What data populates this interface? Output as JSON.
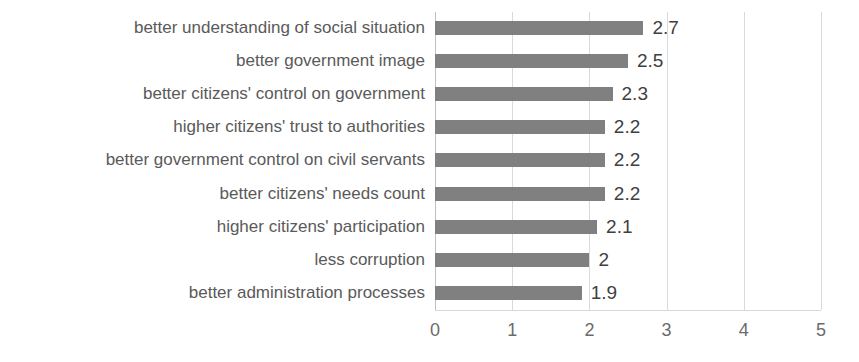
{
  "chart_data": {
    "type": "bar",
    "orientation": "horizontal",
    "title": "",
    "xlabel": "",
    "ylabel": "",
    "xlim": [
      0,
      5
    ],
    "xticks": [
      "0",
      "1",
      "2",
      "3",
      "4",
      "5"
    ],
    "grid": true,
    "legend": "none",
    "bar_color": "#808080",
    "label_color": "#5a5a5a",
    "value_color": "#3f3f3f",
    "gridline_color": "#d9d9d9",
    "categories": [
      "better understanding of social situation",
      "better government image",
      "better citizens' control on government",
      "higher citizens' trust to authorities",
      "better government control on civil servants",
      "better citizens' needs count",
      "higher citizens' participation",
      "less corruption",
      "better administration processes"
    ],
    "values": [
      2.7,
      2.5,
      2.3,
      2.2,
      2.2,
      2.2,
      2.1,
      2,
      1.9
    ],
    "value_labels": [
      "2.7",
      "2.5",
      "2.3",
      "2.2",
      "2.2",
      "2.2",
      "2.1",
      "2",
      "1.9"
    ]
  }
}
